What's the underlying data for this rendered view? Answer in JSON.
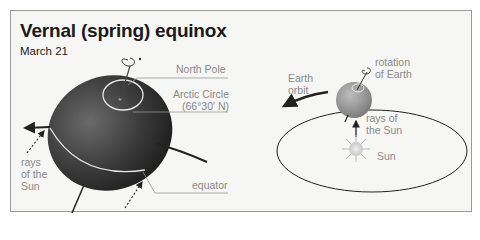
{
  "title": "Vernal (spring) equinox",
  "subtitle": "March 21",
  "left_diagram": {
    "labels": {
      "north_pole": "North Pole",
      "arctic_circle_line1": "Arctic Circle",
      "arctic_circle_line2": "(66°30′ N)",
      "equator": "equator",
      "rays_line1": "rays",
      "rays_line2": "of the",
      "rays_line3": "Sun"
    }
  },
  "right_diagram": {
    "labels": {
      "rotation_line1": "rotation",
      "rotation_line2": "of Earth",
      "orbit_line1": "Earth",
      "orbit_line2": "orbit",
      "rays_line1": "rays of",
      "rays_line2": "the Sun",
      "sun": "Sun"
    }
  },
  "colors": {
    "earth_dark": "#2e2e2e",
    "earth_small": "#8a8a8a",
    "background": "#f6f6f4",
    "label_gray": "#8a8a8a"
  }
}
